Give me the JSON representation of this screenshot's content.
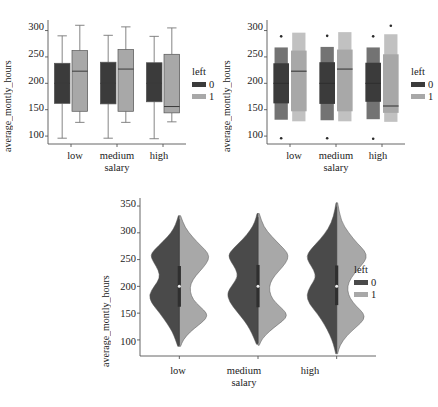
{
  "figure": {
    "title": "",
    "panel_count": 3
  },
  "legend": {
    "title": "left",
    "entries": [
      {
        "label": "0",
        "color": "#3b3b3b"
      },
      {
        "label": "1",
        "color": "#a8a8a8"
      }
    ]
  },
  "chart_data": [
    {
      "type": "box",
      "id": "boxplot",
      "title": "",
      "xlabel": "salary",
      "ylabel": "average_montly_hours",
      "categories": [
        "low",
        "medium",
        "high"
      ],
      "xticklabels": [
        "low",
        "medium",
        "high"
      ],
      "yticklabels": [
        "100",
        "150",
        "200",
        "250",
        "300"
      ],
      "yticks": [
        100,
        150,
        200,
        250,
        300
      ],
      "ylim": [
        85,
        320
      ],
      "grid": false,
      "legend_position": "right",
      "legend_title": "left",
      "series": [
        {
          "name": "0",
          "color": "#3b3b3b",
          "boxes": [
            {
              "category": "low",
              "whisker_low": 96,
              "q1": 162,
              "median": 200,
              "q3": 238,
              "whisker_high": 290
            },
            {
              "category": "medium",
              "whisker_low": 96,
              "q1": 161,
              "median": 200,
              "q3": 240,
              "whisker_high": 291
            },
            {
              "category": "high",
              "whisker_low": 95,
              "q1": 165,
              "median": 200,
              "q3": 239,
              "whisker_high": 289
            }
          ]
        },
        {
          "name": "1",
          "color": "#a8a8a8",
          "boxes": [
            {
              "category": "low",
              "whisker_low": 126,
              "q1": 147,
              "median": 223,
              "q3": 262,
              "whisker_high": 310
            },
            {
              "category": "medium",
              "whisker_low": 126,
              "q1": 147,
              "median": 227,
              "q3": 264,
              "whisker_high": 307
            },
            {
              "category": "high",
              "whisker_low": 127,
              "q1": 144,
              "median": 156,
              "q3": 255,
              "whisker_high": 305
            }
          ]
        }
      ]
    },
    {
      "type": "boxen",
      "id": "boxenplot",
      "title": "",
      "xlabel": "salary",
      "ylabel": "average_montly_hours",
      "categories": [
        "low",
        "medium",
        "high"
      ],
      "xticklabels": [
        "low",
        "medium",
        "high"
      ],
      "yticklabels": [
        "100",
        "150",
        "200",
        "250",
        "300"
      ],
      "yticks": [
        100,
        150,
        200,
        250,
        300
      ],
      "ylim": [
        85,
        320
      ],
      "grid": false,
      "legend_position": "right",
      "legend_title": "left",
      "series": [
        {
          "name": "0",
          "color": "#3b3b3b",
          "groups": [
            {
              "category": "low",
              "median": 200,
              "q1": 162,
              "q3": 238,
              "levels": [
                [
                  131,
                  268
                ],
                [
                  145,
                  255
                ],
                [
                  152,
                  248
                ],
                [
                  157,
                  243
                ]
              ],
              "outliers": [
                96,
                289
              ]
            },
            {
              "category": "medium",
              "median": 200,
              "q1": 161,
              "q3": 240,
              "levels": [
                [
                  130,
                  269
                ],
                [
                  144,
                  256
                ],
                [
                  151,
                  249
                ],
                [
                  156,
                  244
                ]
              ],
              "outliers": [
                96,
                290
              ]
            },
            {
              "category": "high",
              "median": 200,
              "q1": 165,
              "q3": 239,
              "levels": [
                [
                  132,
                  268
                ],
                [
                  147,
                  256
                ],
                [
                  154,
                  249
                ],
                [
                  159,
                  244
                ]
              ],
              "outliers": [
                95,
                289
              ]
            }
          ]
        },
        {
          "name": "1",
          "color": "#a8a8a8",
          "groups": [
            {
              "category": "low",
              "median": 223,
              "q1": 147,
              "q3": 262,
              "levels": [
                [
                  128,
                  296
                ],
                [
                  135,
                  283
                ],
                [
                  140,
                  274
                ],
                [
                  143,
                  268
                ]
              ],
              "outliers": []
            },
            {
              "category": "medium",
              "median": 227,
              "q1": 147,
              "q3": 264,
              "levels": [
                [
                  128,
                  297
                ],
                [
                  135,
                  285
                ],
                [
                  140,
                  276
                ],
                [
                  143,
                  270
                ]
              ],
              "outliers": []
            },
            {
              "category": "high",
              "median": 157,
              "q1": 144,
              "q3": 255,
              "levels": [
                [
                  127,
                  293
                ],
                [
                  134,
                  280
                ],
                [
                  138,
                  271
                ],
                [
                  141,
                  264
                ]
              ],
              "outliers": [
                309
              ]
            }
          ]
        }
      ]
    },
    {
      "type": "violin",
      "id": "violinplot",
      "title": "",
      "xlabel": "salary",
      "ylabel": "average_montly_hours",
      "categories": [
        "low",
        "medium",
        "high"
      ],
      "xticklabels": [
        "low",
        "medium",
        "high"
      ],
      "yticklabels": [
        "100",
        "150",
        "200",
        "250",
        "300",
        "350"
      ],
      "yticks": [
        100,
        150,
        200,
        250,
        300,
        350
      ],
      "ylim": [
        70,
        365
      ],
      "grid": false,
      "split": true,
      "legend_position": "right",
      "legend_title": "left",
      "series": [
        {
          "name": "0",
          "color": "#4a4a4a",
          "violins": [
            {
              "category": "low",
              "min": 88,
              "max": 332,
              "median": 200,
              "q1": 162,
              "q3": 238,
              "modes": [
                178,
                262
              ],
              "density": [
                [
                  88,
                  0.05
                ],
                [
                  100,
                  0.12
                ],
                [
                  115,
                  0.22
                ],
                [
                  130,
                  0.38
                ],
                [
                  150,
                  0.62
                ],
                [
                  170,
                  0.9
                ],
                [
                  185,
                  0.96
                ],
                [
                  200,
                  0.8
                ],
                [
                  215,
                  0.62
                ],
                [
                  230,
                  0.66
                ],
                [
                  245,
                  0.82
                ],
                [
                  258,
                  0.92
                ],
                [
                  268,
                  0.8
                ],
                [
                  285,
                  0.5
                ],
                [
                  300,
                  0.26
                ],
                [
                  315,
                  0.12
                ],
                [
                  332,
                  0.03
                ]
              ]
            },
            {
              "category": "medium",
              "min": 92,
              "max": 336,
              "median": 200,
              "q1": 161,
              "q3": 240,
              "modes": [
                180,
                258
              ],
              "density": [
                [
                  92,
                  0.05
                ],
                [
                  105,
                  0.14
                ],
                [
                  120,
                  0.26
                ],
                [
                  135,
                  0.42
                ],
                [
                  152,
                  0.66
                ],
                [
                  172,
                  0.92
                ],
                [
                  188,
                  0.98
                ],
                [
                  202,
                  0.82
                ],
                [
                  218,
                  0.64
                ],
                [
                  232,
                  0.7
                ],
                [
                  246,
                  0.86
                ],
                [
                  258,
                  0.95
                ],
                [
                  270,
                  0.8
                ],
                [
                  288,
                  0.48
                ],
                [
                  305,
                  0.24
                ],
                [
                  320,
                  0.1
                ],
                [
                  336,
                  0.03
                ]
              ]
            },
            {
              "category": "high",
              "min": 74,
              "max": 356,
              "median": 200,
              "q1": 165,
              "q3": 239,
              "modes": [
                182,
                255
              ],
              "density": [
                [
                  74,
                  0.03
                ],
                [
                  92,
                  0.1
                ],
                [
                  110,
                  0.22
                ],
                [
                  128,
                  0.38
                ],
                [
                  148,
                  0.6
                ],
                [
                  168,
                  0.88
                ],
                [
                  184,
                  0.96
                ],
                [
                  200,
                  0.84
                ],
                [
                  216,
                  0.66
                ],
                [
                  230,
                  0.72
                ],
                [
                  244,
                  0.88
                ],
                [
                  256,
                  0.96
                ],
                [
                  268,
                  0.84
                ],
                [
                  288,
                  0.52
                ],
                [
                  308,
                  0.26
                ],
                [
                  330,
                  0.1
                ],
                [
                  356,
                  0.02
                ]
              ]
            }
          ]
        },
        {
          "name": "1",
          "color": "#a8a8a8",
          "violins": [
            {
              "category": "low",
              "min": 88,
              "max": 332,
              "median": 205,
              "q1": 148,
              "q3": 258,
              "modes": [
                145,
                258
              ],
              "density": [
                [
                  88,
                  0.04
                ],
                [
                  100,
                  0.12
                ],
                [
                  115,
                  0.34
                ],
                [
                  128,
                  0.62
                ],
                [
                  140,
                  0.86
                ],
                [
                  150,
                  0.88
                ],
                [
                  162,
                  0.66
                ],
                [
                  175,
                  0.44
                ],
                [
                  190,
                  0.34
                ],
                [
                  205,
                  0.36
                ],
                [
                  220,
                  0.52
                ],
                [
                  235,
                  0.76
                ],
                [
                  250,
                  0.94
                ],
                [
                  262,
                  0.92
                ],
                [
                  275,
                  0.7
                ],
                [
                  292,
                  0.42
                ],
                [
                  310,
                  0.18
                ],
                [
                  332,
                  0.04
                ]
              ]
            },
            {
              "category": "medium",
              "min": 90,
              "max": 336,
              "median": 205,
              "q1": 148,
              "q3": 260,
              "modes": [
                145,
                255
              ],
              "density": [
                [
                  90,
                  0.04
                ],
                [
                  102,
                  0.13
                ],
                [
                  116,
                  0.36
                ],
                [
                  129,
                  0.64
                ],
                [
                  141,
                  0.9
                ],
                [
                  151,
                  0.9
                ],
                [
                  163,
                  0.68
                ],
                [
                  176,
                  0.46
                ],
                [
                  191,
                  0.36
                ],
                [
                  206,
                  0.38
                ],
                [
                  221,
                  0.54
                ],
                [
                  236,
                  0.78
                ],
                [
                  251,
                  0.96
                ],
                [
                  263,
                  0.94
                ],
                [
                  276,
                  0.72
                ],
                [
                  293,
                  0.44
                ],
                [
                  311,
                  0.18
                ],
                [
                  336,
                  0.04
                ]
              ]
            },
            {
              "category": "high",
              "min": 74,
              "max": 356,
              "median": 200,
              "q1": 146,
              "q3": 256,
              "modes": [
                143,
                252
              ],
              "density": [
                [
                  74,
                  0.03
                ],
                [
                  90,
                  0.1
                ],
                [
                  108,
                  0.32
                ],
                [
                  124,
                  0.62
                ],
                [
                  138,
                  0.88
                ],
                [
                  150,
                  0.86
                ],
                [
                  163,
                  0.62
                ],
                [
                  178,
                  0.42
                ],
                [
                  193,
                  0.34
                ],
                [
                  208,
                  0.38
                ],
                [
                  224,
                  0.56
                ],
                [
                  240,
                  0.8
                ],
                [
                  253,
                  0.96
                ],
                [
                  266,
                  0.9
                ],
                [
                  280,
                  0.66
                ],
                [
                  300,
                  0.38
                ],
                [
                  322,
                  0.14
                ],
                [
                  356,
                  0.03
                ]
              ]
            }
          ]
        }
      ]
    }
  ]
}
